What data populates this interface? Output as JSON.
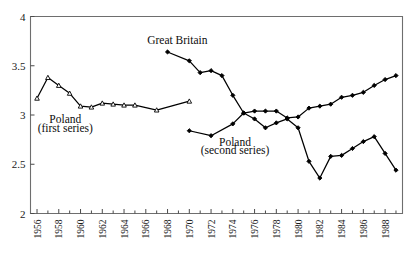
{
  "chart_data": {
    "type": "line",
    "title": "",
    "subtitle": "",
    "xlabel": "",
    "ylabel": "",
    "xlim": [
      1955.4,
      1989.6
    ],
    "ylim": [
      2,
      4
    ],
    "grid": false,
    "legend_position": "inline-annotations",
    "y_ticks": [
      "2",
      "2.5",
      "3",
      "3.5",
      "4"
    ],
    "y_tick_values": [
      2,
      2.5,
      3,
      3.5,
      4
    ],
    "x_ticks": [
      "1956",
      "1958",
      "1960",
      "1962",
      "1964",
      "1966",
      "1968",
      "1970",
      "1972",
      "1974",
      "1976",
      "1978",
      "1980",
      "1982",
      "1984",
      "1986",
      "1988"
    ],
    "x_tick_values": [
      1956,
      1958,
      1960,
      1962,
      1964,
      1966,
      1968,
      1970,
      1972,
      1974,
      1976,
      1978,
      1980,
      1982,
      1984,
      1986,
      1988
    ],
    "x_minor_ticks": [
      1957,
      1959,
      1961,
      1963,
      1965,
      1967,
      1969,
      1971,
      1973,
      1975,
      1977,
      1979,
      1981,
      1983,
      1985,
      1987,
      1989
    ],
    "series": [
      {
        "name": "Poland (first series)",
        "marker": "open-triangle",
        "color": "#000000",
        "x": [
          1956,
          1957,
          1958,
          1959,
          1960,
          1961,
          1962,
          1963,
          1964,
          1965,
          1967,
          1970
        ],
        "values": [
          3.17,
          3.38,
          3.3,
          3.22,
          3.09,
          3.08,
          3.12,
          3.11,
          3.1,
          3.1,
          3.05,
          3.14
        ]
      },
      {
        "name": "Great Britain",
        "marker": "filled-diamond",
        "color": "#000000",
        "x": [
          1968,
          1970,
          1971,
          1972,
          1973,
          1974,
          1975,
          1976,
          1977,
          1978,
          1979,
          1980,
          1981,
          1982,
          1983,
          1984,
          1985,
          1986,
          1987,
          1988,
          1989
        ],
        "values": [
          3.64,
          3.55,
          3.43,
          3.45,
          3.4,
          3.2,
          3.02,
          2.96,
          2.87,
          2.92,
          2.96,
          2.87,
          2.53,
          2.36,
          2.58,
          2.59,
          2.66,
          2.73,
          2.78,
          2.61,
          2.44
        ]
      },
      {
        "name": "Poland (second series)",
        "marker": "filled-diamond",
        "color": "#000000",
        "x": [
          1970,
          1972,
          1974,
          1975,
          1976,
          1977,
          1978,
          1979,
          1980,
          1981,
          1982,
          1983,
          1984,
          1985,
          1986,
          1987,
          1988,
          1989
        ],
        "values": [
          2.84,
          2.79,
          2.91,
          3.02,
          3.04,
          3.04,
          3.04,
          2.97,
          2.98,
          3.07,
          3.09,
          3.11,
          3.18,
          3.2,
          3.23,
          3.3,
          3.36,
          3.4
        ]
      }
    ],
    "annotations": [
      {
        "id": "great-britain",
        "text": "Great Britain",
        "x": 1968.9,
        "y": 3.72
      },
      {
        "id": "poland-first-line1",
        "text": "Poland",
        "x": 1958.6,
        "y": 2.92
      },
      {
        "id": "poland-first-line2",
        "text": "(first series)",
        "x": 1958.6,
        "y": 2.83
      },
      {
        "id": "poland-second-line1",
        "text": "Poland",
        "x": 1974.2,
        "y": 2.69
      },
      {
        "id": "poland-second-line2",
        "text": "(second series)",
        "x": 1974.2,
        "y": 2.6
      }
    ]
  }
}
